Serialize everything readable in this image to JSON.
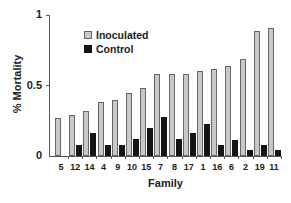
{
  "chart_data": {
    "type": "bar",
    "title": "",
    "xlabel": "Family",
    "ylabel": "% Mortality",
    "ylim": [
      0,
      1
    ],
    "yticks": [
      "0",
      "0.5",
      "1"
    ],
    "grid": false,
    "legend_position": "upper-left inside",
    "categories": [
      "5",
      "12",
      "14",
      "4",
      "9",
      "10",
      "15",
      "7",
      "8",
      "17",
      "1",
      "16",
      "6",
      "2",
      "19",
      "11"
    ],
    "series": [
      {
        "name": "Inoculated",
        "color": "#c8c8c8",
        "values": [
          0.27,
          0.29,
          0.32,
          0.38,
          0.4,
          0.45,
          0.48,
          0.58,
          0.58,
          0.58,
          0.6,
          0.62,
          0.64,
          0.69,
          0.89,
          0.91
        ]
      },
      {
        "name": "Control",
        "color": "#151515",
        "values": [
          0.0,
          0.08,
          0.16,
          0.08,
          0.08,
          0.12,
          0.2,
          0.28,
          0.12,
          0.16,
          0.23,
          0.08,
          0.11,
          0.04,
          0.08,
          0.04
        ]
      }
    ]
  }
}
